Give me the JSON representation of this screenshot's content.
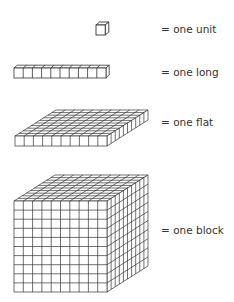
{
  "items": [
    {
      "name": "unit",
      "label": "= one unit",
      "grid": [
        1,
        1,
        1
      ]
    },
    {
      "name": "long",
      "label": "= one long",
      "grid": [
        10,
        1,
        1
      ]
    },
    {
      "name": "flat",
      "label": "= one flat",
      "grid": [
        10,
        1,
        10
      ]
    },
    {
      "name": "block",
      "label": "= one block",
      "grid": [
        10,
        10,
        10
      ]
    }
  ],
  "colors": {
    "stroke": "#333333",
    "face": "#ffffff",
    "text": "#333333"
  }
}
